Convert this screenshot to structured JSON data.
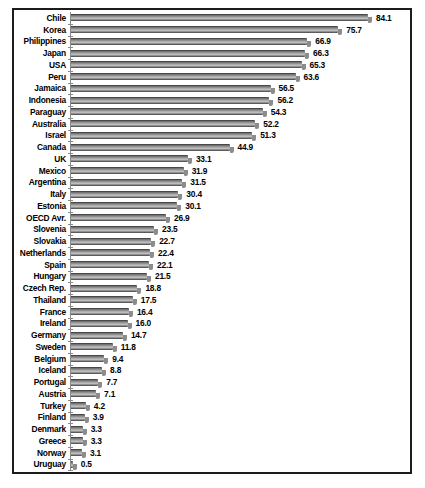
{
  "chart_data": {
    "type": "bar",
    "orientation": "horizontal",
    "title": "",
    "xlabel": "",
    "ylabel": "",
    "xlim": [
      0,
      96
    ],
    "grid": false,
    "legend": "none",
    "value_label_format": "one-decimal",
    "categories": [
      "Chile",
      "Korea",
      "Philippines",
      "Japan",
      "USA",
      "Peru",
      "Jamaica",
      "Indonesia",
      "Paraguay",
      "Australia",
      "Israel",
      "Canada",
      "UK",
      "Mexico",
      "Argentina",
      "Italy",
      "Estonia",
      "OECD Avr.",
      "Slovenia",
      "Slovakia",
      "Netherlands",
      "Spain",
      "Hungary",
      "Czech Rep.",
      "Thailand",
      "France",
      "Ireland",
      "Germany",
      "Sweden",
      "Belgium",
      "Iceland",
      "Portugal",
      "Austria",
      "Turkey",
      "Finland",
      "Denmark",
      "Greece",
      "Norway",
      "Uruguay"
    ],
    "values": [
      84.1,
      75.7,
      66.9,
      66.3,
      65.3,
      63.6,
      56.5,
      56.2,
      54.3,
      52.2,
      51.3,
      44.9,
      33.1,
      31.9,
      31.5,
      30.4,
      30.1,
      26.9,
      23.5,
      22.7,
      22.4,
      22.1,
      21.5,
      18.8,
      17.5,
      16.4,
      16.0,
      14.7,
      11.8,
      9.4,
      8.8,
      7.7,
      7.1,
      4.2,
      3.9,
      3.3,
      3.3,
      3.1,
      0.5
    ]
  },
  "colors": {
    "frame_border": "#1c1c1c",
    "background": "#ffffff",
    "bar_dark": "#2f2f2f",
    "bar_light": "#c4c4c4",
    "bar_shadow": "#8c8c8c",
    "axis": "#8a8a8a",
    "text": "#000000"
  }
}
